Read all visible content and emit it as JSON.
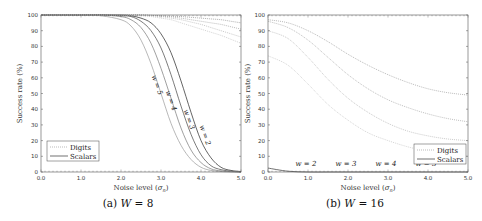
{
  "chart_data": [
    {
      "type": "line",
      "id": "a",
      "caption": "(a) W = 8",
      "caption_prefix": "(a) ",
      "caption_var": "W",
      "caption_value": " = 8",
      "xlabel": "Noise level (σ_n)",
      "ylabel": "Success rate (%)",
      "xlim": [
        0,
        5
      ],
      "ylim": [
        0,
        100
      ],
      "xticks": [
        "0.0",
        "1.0",
        "2.0",
        "3.0",
        "4.0",
        "5.0"
      ],
      "yticks": [
        "0",
        "10",
        "20",
        "30",
        "40",
        "50",
        "60",
        "70",
        "80",
        "90",
        "100"
      ],
      "grid": false,
      "legend": {
        "position": "lower left",
        "entries": [
          "Digits",
          "Scalars"
        ]
      },
      "x": [
        0.0,
        0.5,
        1.0,
        1.5,
        2.0,
        2.25,
        2.5,
        2.75,
        3.0,
        3.25,
        3.5,
        3.75,
        4.0,
        4.25,
        4.5,
        4.75,
        5.0
      ],
      "series": [
        {
          "name": "Scalars w=2",
          "style": "solid",
          "values": [
            100,
            100,
            100,
            100,
            100,
            99.5,
            98,
            95,
            88,
            76,
            58,
            38,
            20,
            9,
            3,
            1,
            0.3
          ]
        },
        {
          "name": "Scalars w=3",
          "style": "solid",
          "values": [
            100,
            100,
            100,
            100,
            99.5,
            99,
            96,
            90,
            79,
            62,
            42,
            24,
            11,
            4,
            1.5,
            0.5,
            0.1
          ]
        },
        {
          "name": "Scalars w=4",
          "style": "solid",
          "values": [
            100,
            100,
            100,
            100,
            99,
            97,
            92,
            82,
            66,
            47,
            28,
            14,
            6,
            2,
            0.7,
            0.2,
            0
          ]
        },
        {
          "name": "Scalars w=5",
          "style": "solid",
          "values": [
            100,
            100,
            100,
            99.5,
            97,
            93,
            84,
            69,
            50,
            31,
            17,
            8,
            3,
            1,
            0.3,
            0.1,
            0
          ]
        },
        {
          "name": "Digits w=2",
          "style": "dotted",
          "values": [
            100,
            100,
            100,
            100,
            100,
            100,
            100,
            99.8,
            99.5,
            99.2,
            99,
            98.5,
            98,
            97.5,
            97,
            96,
            95
          ]
        },
        {
          "name": "Digits w=3",
          "style": "dotted",
          "values": [
            100,
            100,
            100,
            100,
            100,
            100,
            100,
            99.7,
            99.3,
            98.8,
            98,
            97,
            96,
            95,
            94,
            92.5,
            91
          ]
        },
        {
          "name": "Digits w=4",
          "style": "dotted",
          "values": [
            100,
            100,
            100,
            100,
            100,
            100,
            99.8,
            99.5,
            99,
            98,
            97,
            95.5,
            94,
            92,
            90,
            88,
            86
          ]
        },
        {
          "name": "Digits w=5",
          "style": "dotted",
          "values": [
            100,
            100,
            100,
            100,
            100,
            99.8,
            99.5,
            99,
            98,
            97,
            95,
            93,
            91,
            89,
            87,
            84.5,
            82
          ]
        }
      ],
      "annotations": [
        {
          "text": "w = 5",
          "x": 2.85,
          "y": 55,
          "rotation": 70
        },
        {
          "text": "w = 4",
          "x": 3.2,
          "y": 45,
          "rotation": 70
        },
        {
          "text": "w = 3",
          "x": 3.65,
          "y": 33,
          "rotation": 70
        },
        {
          "text": "w = 2",
          "x": 4.05,
          "y": 23,
          "rotation": 70
        }
      ]
    },
    {
      "type": "line",
      "id": "b",
      "caption": "(b) W = 16",
      "caption_prefix": "(b) ",
      "caption_var": "W",
      "caption_value": " = 16",
      "xlabel": "Noise level (σ_n)",
      "ylabel": "Success rate (%)",
      "xlim": [
        0,
        5
      ],
      "ylim": [
        0,
        100
      ],
      "xticks": [
        "0.0",
        "1.0",
        "2.0",
        "3.0",
        "4.0",
        "5.0"
      ],
      "yticks": [
        "0",
        "10",
        "20",
        "30",
        "40",
        "50",
        "60",
        "70",
        "80",
        "90",
        "100"
      ],
      "grid": false,
      "legend": {
        "position": "lower right",
        "entries": [
          "Digits",
          "Scalars"
        ]
      },
      "x": [
        0.0,
        0.5,
        1.0,
        1.5,
        2.0,
        2.5,
        3.0,
        3.5,
        4.0,
        4.5,
        5.0
      ],
      "series": [
        {
          "name": "Digits w=2",
          "style": "dotted",
          "values": [
            97,
            95,
            90,
            83,
            75,
            68,
            62,
            57,
            53,
            50.5,
            49
          ]
        },
        {
          "name": "Digits w=3",
          "style": "dotted",
          "values": [
            96,
            92,
            84,
            73,
            62,
            53,
            46,
            41,
            37,
            34,
            32
          ]
        },
        {
          "name": "Digits w=4",
          "style": "dotted",
          "values": [
            90,
            85,
            73,
            59,
            47,
            38,
            31,
            26,
            23,
            21,
            20
          ]
        },
        {
          "name": "Digits w=5",
          "style": "dotted",
          "values": [
            74,
            68,
            56,
            43,
            33,
            25,
            20,
            16,
            13,
            11,
            10
          ]
        },
        {
          "name": "Scalars",
          "style": "solid",
          "values": [
            2.5,
            0.5,
            0,
            0,
            0,
            0,
            0,
            0,
            0,
            0,
            0
          ]
        }
      ],
      "annotations": [
        {
          "text": "w = 2",
          "x": 0.95,
          "y": 4
        },
        {
          "text": "w = 3",
          "x": 1.95,
          "y": 4
        },
        {
          "text": "w = 4",
          "x": 2.95,
          "y": 4
        },
        {
          "text": "w = 5",
          "x": 3.95,
          "y": 4
        }
      ]
    }
  ],
  "labels": {
    "xlabel_prefix": "Noise level (",
    "xlabel_sigma": "σ",
    "xlabel_sub": "n",
    "xlabel_suffix": ")",
    "ylabel": "Success rate (%)",
    "legend_digits": "Digits",
    "legend_scalars": "Scalars"
  },
  "colors": {
    "scalars_a": [
      "#222222",
      "#444444",
      "#777777",
      "#9a9a9a"
    ],
    "digits_a": [
      "#9a9a9a",
      "#aaaaaa",
      "#bbbbbb",
      "#c8c8c8"
    ],
    "digits_b": [
      "#a8a8a8",
      "#b0b0b0",
      "#bcbcbc",
      "#cacaca"
    ],
    "scalars_b": "#333333",
    "axis": "#555555"
  }
}
